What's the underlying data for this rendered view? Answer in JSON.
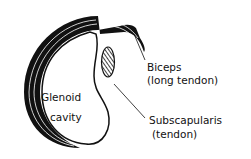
{
  "diagram": {
    "labels": {
      "glenoid_line1": "Glenoid",
      "glenoid_line2": "cavity",
      "biceps_line1": "Biceps",
      "biceps_line2": "(long tendon)",
      "subscap_line1": "Subscapularis",
      "subscap_line2": "(tendon)"
    },
    "colors": {
      "ink": "#111111",
      "background": "#ffffff"
    }
  }
}
